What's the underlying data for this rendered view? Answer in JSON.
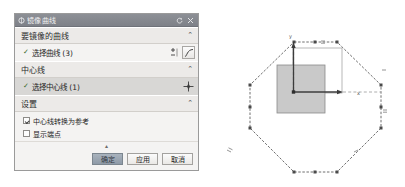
{
  "dialog": {
    "title": "镜像曲线",
    "title_icon": "mirror-icon",
    "reset_icon": "reset-icon",
    "close_icon": "close-icon",
    "collapse_glyph": "⌃",
    "check_glyph": "✓",
    "sections": [
      {
        "key": "curves",
        "header": "要镜像的曲线",
        "row_label": "选择曲线 (3)",
        "selected": false,
        "tools": [
          "select-plus-minus-icon",
          "curve-icon"
        ]
      },
      {
        "key": "centerline",
        "header": "中心线",
        "row_label": "选择中心线 (1)",
        "selected": true,
        "tools": [
          "point-cross-icon"
        ]
      },
      {
        "key": "settings",
        "header": "设置",
        "checkboxes": [
          {
            "label": "中心线转换为参考",
            "checked": true
          },
          {
            "label": "显示端点",
            "checked": false
          }
        ]
      }
    ],
    "grip_glyph": "▴",
    "buttons": {
      "ok": "确定",
      "apply": "应用",
      "cancel": "取消"
    }
  },
  "sketch": {
    "name": "cad-sketch-view",
    "axis_labels": {
      "x": "x",
      "y": "y"
    },
    "colors": {
      "outline": "#6f6f6f",
      "fill": "#c8c8c8",
      "axis": "#4d4d4d",
      "reference": "#9a9a9a",
      "background": "#ffffff"
    },
    "shapes": {
      "octagon": {
        "type": "octagon",
        "points": "91,42 134,42 178,85 178,128 134,172 91,172 47,128 47,85"
      },
      "filled_square": {
        "x": 74,
        "y": 65,
        "width": 48,
        "height": 48
      },
      "reference_rect": {
        "x": 90,
        "y": 48,
        "width": 49,
        "height": 45
      }
    },
    "constraint_marks": [
      "==",
      "=",
      "//"
    ]
  }
}
